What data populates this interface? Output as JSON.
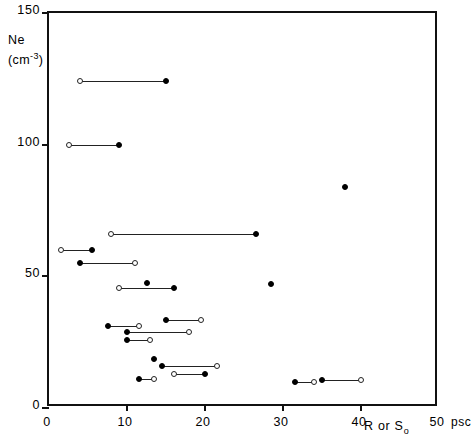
{
  "chart_data": {
    "type": "scatter",
    "title": "",
    "xlabel": "R or S₀",
    "xunit": "psc",
    "ylabel": "Ne (cm⁻³)",
    "ylabel_line1": "Ne",
    "ylabel_line2_pre": "(cm",
    "ylabel_line2_sup": "-3",
    "ylabel_line2_post": ")",
    "xlim": [
      0,
      50
    ],
    "ylim": [
      0,
      150
    ],
    "xticks": [
      0,
      10,
      20,
      30,
      40,
      50
    ],
    "xtick_labels": [
      "0",
      "10",
      "20",
      "30",
      "40",
      "50"
    ],
    "yticks": [
      0,
      50,
      100,
      150
    ],
    "ytick_labels": [
      "0",
      "50",
      "100",
      "150"
    ],
    "grid": false,
    "legend": "none",
    "marker_types": {
      "filled": "filled-circle",
      "open": "open-circle"
    },
    "pairs": [
      {
        "y": 124.0,
        "open_x": 4.0,
        "filled_x": 15.0
      },
      {
        "y": 100.0,
        "open_x": 2.5,
        "filled_x": 9.0
      },
      {
        "y": 66.0,
        "open_x": 8.0,
        "filled_x": 26.5
      },
      {
        "y": 60.0,
        "open_x": 1.5,
        "filled_x": 5.5
      },
      {
        "y": 55.0,
        "open_x": 11.0,
        "filled_x": 4.0
      },
      {
        "y": 45.5,
        "open_x": 9.0,
        "filled_x": 16.0
      },
      {
        "y": 33.5,
        "open_x": 19.5,
        "filled_x": 15.0
      },
      {
        "y": 31.0,
        "open_x": 11.5,
        "filled_x": 7.5
      },
      {
        "y": 29.0,
        "open_x": 18.0,
        "filled_x": 10.0
      },
      {
        "y": 26.0,
        "open_x": 13.0,
        "filled_x": 10.0
      },
      {
        "y": 16.0,
        "open_x": 21.5,
        "filled_x": 14.5
      },
      {
        "y": 13.0,
        "open_x": 16.0,
        "filled_x": 20.0
      },
      {
        "y": 11.0,
        "open_x": 13.5,
        "filled_x": 11.5
      },
      {
        "y": 10.0,
        "open_x": 34.0,
        "filled_x": 31.5
      },
      {
        "y": 10.5,
        "open_x": 40.0,
        "filled_x": 35.0
      }
    ],
    "singles": [
      {
        "x": 38.0,
        "y": 84.0,
        "marker": "filled"
      },
      {
        "x": 28.5,
        "y": 47.0,
        "marker": "filled"
      },
      {
        "x": 12.5,
        "y": 47.5,
        "marker": "filled"
      },
      {
        "x": 13.5,
        "y": 18.5,
        "marker": "filled"
      }
    ]
  },
  "colors": {
    "axis": "#111111",
    "marker_fill": "#000000",
    "marker_open_edge": "#222222",
    "connector": "#222222",
    "background": "#ffffff"
  }
}
